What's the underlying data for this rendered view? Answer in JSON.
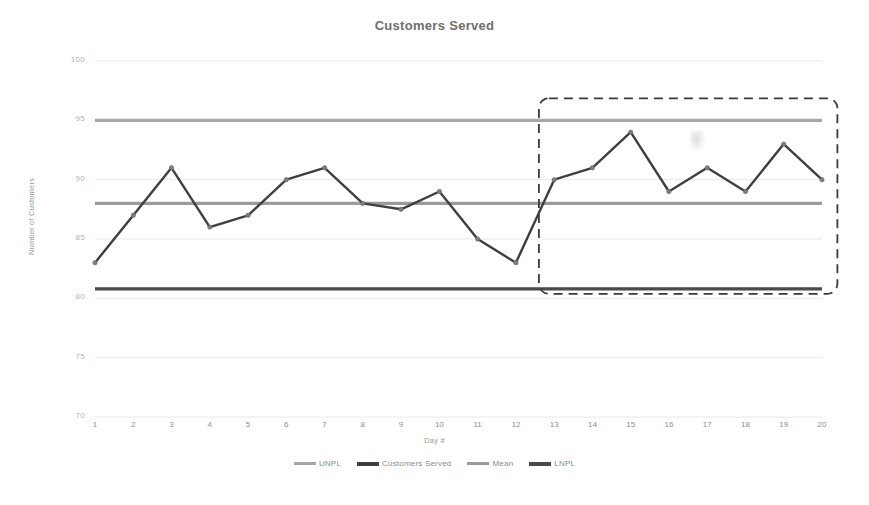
{
  "chart_data": {
    "type": "line",
    "title": "Customers Served",
    "xlabel": "Day #",
    "ylabel": "Number of Customers",
    "ylim": [
      70,
      100
    ],
    "xlim": [
      1,
      20
    ],
    "grid": true,
    "legend_position": "bottom",
    "y_ticks": [
      "100",
      "95",
      "90",
      "85",
      "80",
      "75",
      "70"
    ],
    "y_tick_values": [
      100,
      95,
      90,
      85,
      80,
      75,
      70
    ],
    "categories": [
      "1",
      "2",
      "3",
      "4",
      "5",
      "6",
      "7",
      "8",
      "9",
      "10",
      "11",
      "12",
      "13",
      "14",
      "15",
      "16",
      "17",
      "18",
      "19",
      "20"
    ],
    "x": [
      1,
      2,
      3,
      4,
      5,
      6,
      7,
      8,
      9,
      10,
      11,
      12,
      13,
      14,
      15,
      16,
      17,
      18,
      19,
      20
    ],
    "series": [
      {
        "name": "UNPL",
        "type": "constant-limit",
        "value": 95,
        "values": [
          95,
          95,
          95,
          95,
          95,
          95,
          95,
          95,
          95,
          95,
          95,
          95,
          95,
          95,
          95,
          95,
          95,
          95,
          95,
          95
        ],
        "color": "#a6a6a6"
      },
      {
        "name": "Customers Served",
        "type": "line-markers",
        "values": [
          83,
          87,
          91,
          86,
          87,
          90,
          91,
          88,
          87.5,
          89,
          85,
          83,
          90,
          91,
          94,
          89,
          91,
          89,
          93,
          90
        ],
        "color": "#3f3f3f"
      },
      {
        "name": "Mean",
        "type": "constant-limit",
        "value": 88,
        "values": [
          88,
          88,
          88,
          88,
          88,
          88,
          88,
          88,
          88,
          88,
          88,
          88,
          88,
          88,
          88,
          88,
          88,
          88,
          88,
          88
        ],
        "color": "#9b9b9b"
      },
      {
        "name": "LNPL",
        "type": "constant-limit",
        "value": 80.8,
        "values": [
          80.8,
          80.8,
          80.8,
          80.8,
          80.8,
          80.8,
          80.8,
          80.8,
          80.8,
          80.8,
          80.8,
          80.8,
          80.8,
          80.8,
          80.8,
          80.8,
          80.8,
          80.8,
          80.8,
          80.8
        ],
        "color": "#4a4a4a"
      }
    ],
    "annotations": [
      {
        "name": "highlight-box",
        "type": "dashed-rectangle",
        "x_range": [
          12.6,
          20.4
        ],
        "y_range": [
          80.8,
          95.0
        ],
        "color": "#3a3a3a",
        "label": ""
      }
    ]
  },
  "legend": {
    "items": [
      {
        "label": "UNPL",
        "color": "#a6a6a6"
      },
      {
        "label": "Customers Served",
        "color": "#3f3f3f"
      },
      {
        "label": "Mean",
        "color": "#9b9b9b"
      },
      {
        "label": "LNPL",
        "color": "#4a4a4a"
      }
    ]
  }
}
